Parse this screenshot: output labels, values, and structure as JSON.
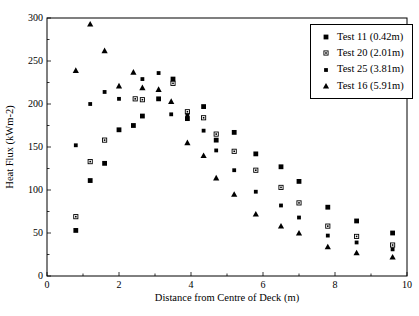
{
  "figure": {
    "xlabel": "Distance from Centre of Deck (m)",
    "ylabel": "Heat Flux (kWm-2)"
  },
  "chart_data": {
    "type": "scatter",
    "title": "",
    "xlabel": "Distance from Centre of Deck (m)",
    "ylabel": "Heat Flux (kWm-2)",
    "xlim": [
      0,
      10
    ],
    "ylim": [
      0,
      300
    ],
    "x_major_ticks": [
      0,
      2,
      4,
      6,
      8,
      10
    ],
    "x_minor_step": 1,
    "y_major_ticks": [
      0,
      50,
      100,
      150,
      200,
      250,
      300
    ],
    "y_minor_step": 25,
    "grid": false,
    "legend_position": "top-right-inside",
    "colors": {
      "marker": "#000000",
      "frame": "#000000",
      "background": "#ffffff"
    },
    "series": [
      {
        "name": "Test 11 (0.42m)",
        "marker": "filled-square",
        "points": [
          [
            0.8,
            53
          ],
          [
            1.2,
            111
          ],
          [
            1.6,
            131
          ],
          [
            2.0,
            170
          ],
          [
            2.4,
            175
          ],
          [
            2.65,
            186
          ],
          [
            3.1,
            206
          ],
          [
            3.5,
            229
          ],
          [
            3.9,
            183
          ],
          [
            4.35,
            197
          ],
          [
            4.7,
            158
          ],
          [
            5.2,
            167
          ],
          [
            5.8,
            142
          ],
          [
            6.5,
            127
          ],
          [
            7.0,
            110
          ],
          [
            7.8,
            80
          ],
          [
            8.6,
            64
          ],
          [
            9.6,
            50
          ]
        ]
      },
      {
        "name": "Test 20 (2.01m)",
        "marker": "open-square-dot",
        "points": [
          [
            0.8,
            69
          ],
          [
            1.2,
            133
          ],
          [
            1.6,
            158
          ],
          [
            2.45,
            206
          ],
          [
            2.65,
            205
          ],
          [
            3.5,
            224
          ],
          [
            3.9,
            191
          ],
          [
            4.35,
            184
          ],
          [
            4.7,
            165
          ],
          [
            5.2,
            145
          ],
          [
            5.8,
            123
          ],
          [
            6.5,
            103
          ],
          [
            7.0,
            85
          ],
          [
            7.8,
            58
          ],
          [
            8.6,
            46
          ],
          [
            9.6,
            36
          ]
        ]
      },
      {
        "name": "Test 25 (3.81m)",
        "marker": "small-filled-square",
        "points": [
          [
            0.8,
            152
          ],
          [
            1.2,
            200
          ],
          [
            1.6,
            214
          ],
          [
            2.0,
            206
          ],
          [
            2.65,
            229
          ],
          [
            3.1,
            236
          ],
          [
            3.45,
            188
          ],
          [
            3.9,
            187
          ],
          [
            4.35,
            169
          ],
          [
            4.7,
            146
          ],
          [
            5.2,
            123
          ],
          [
            5.8,
            98
          ],
          [
            6.5,
            82
          ],
          [
            7.0,
            68
          ],
          [
            7.8,
            47
          ],
          [
            8.6,
            39
          ],
          [
            9.6,
            31
          ]
        ]
      },
      {
        "name": "Test 16 (5.91m)",
        "marker": "filled-triangle",
        "points": [
          [
            0.8,
            239
          ],
          [
            1.2,
            293
          ],
          [
            1.6,
            262
          ],
          [
            2.0,
            221
          ],
          [
            2.4,
            237
          ],
          [
            2.65,
            219
          ],
          [
            3.1,
            217
          ],
          [
            3.45,
            203
          ],
          [
            3.9,
            155
          ],
          [
            4.35,
            140
          ],
          [
            4.7,
            114
          ],
          [
            5.2,
            95
          ],
          [
            5.8,
            72
          ],
          [
            6.5,
            58
          ],
          [
            7.0,
            50
          ],
          [
            7.8,
            34
          ],
          [
            8.6,
            27
          ],
          [
            9.6,
            22
          ]
        ]
      }
    ]
  }
}
